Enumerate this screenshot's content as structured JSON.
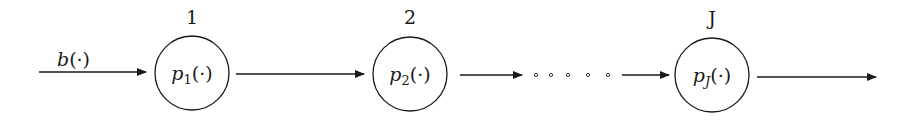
{
  "diagram": {
    "type": "serial-chain",
    "input": {
      "label_base": "b",
      "label_arg": "(·)"
    },
    "nodes": [
      {
        "index_label": "1",
        "func_base": "p",
        "func_sub": "1",
        "func_arg": "(·)"
      },
      {
        "index_label": "2",
        "func_base": "p",
        "func_sub": "2",
        "func_arg": "(·)"
      },
      {
        "index_label": "J",
        "func_base": "p",
        "func_sub": "J",
        "func_arg": "(·)"
      }
    ],
    "ellipsis": "· · · · ·",
    "colors": {
      "stroke": "#1a1a1a",
      "background": "#ffffff"
    }
  }
}
